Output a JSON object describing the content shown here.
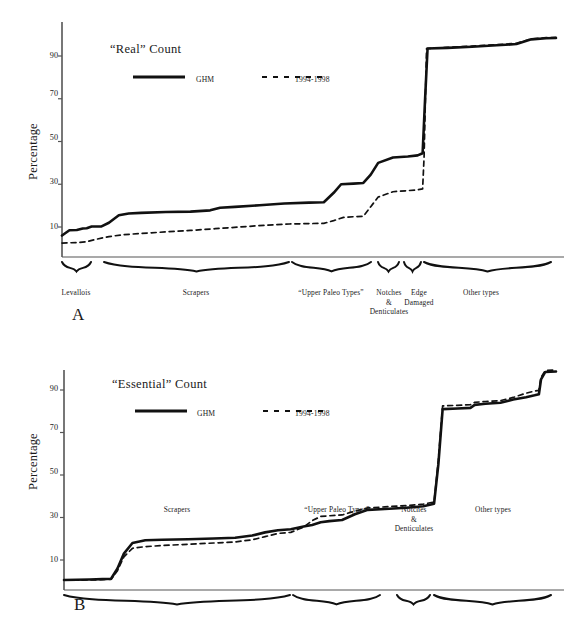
{
  "figure": {
    "background": "#ffffff",
    "line_color": "#111111",
    "axis_color": "#555555"
  },
  "panels": [
    {
      "letter": "A",
      "legend_title": "“Real” Count",
      "legend": [
        {
          "style": "solid",
          "label": "GHM"
        },
        {
          "style": "dashed",
          "label": "1994-1998"
        }
      ],
      "ylabel": "Percentage",
      "yticks": [
        10,
        30,
        50,
        70,
        90
      ],
      "groups": [
        {
          "label": "Levallois",
          "x0": 62,
          "x1": 91
        },
        {
          "label": "Scrapers",
          "x0": 104,
          "x1": 289
        },
        {
          "label": "“Upper Paleo Types”",
          "x0": 292,
          "x1": 371
        },
        {
          "label": "Notches\n&\nDenticulates",
          "x0": 378,
          "x1": 399
        },
        {
          "label": "Edge\nDamaged",
          "x0": 404,
          "x1": 421
        },
        {
          "label": "Other types",
          "x0": 424,
          "x1": 551
        }
      ]
    },
    {
      "letter": "B",
      "legend_title": "“Essential” Count",
      "legend": [
        {
          "style": "solid",
          "label": "GHM"
        },
        {
          "style": "dashed",
          "label": "1994-1998"
        }
      ],
      "ylabel": "Percentage",
      "yticks": [
        10,
        30,
        50,
        70,
        90
      ],
      "groups": [
        {
          "label": "Scrapers",
          "x0": 64,
          "x1": 290
        },
        {
          "label": "“Upper Paleo Types”",
          "x0": 293,
          "x1": 380
        },
        {
          "label": "Notches\n&\nDenticulates",
          "x0": 397,
          "x1": 430
        },
        {
          "label": "Other types",
          "x0": 434,
          "x1": 551
        }
      ]
    }
  ],
  "chart_data": [
    {
      "type": "line",
      "title": "“Real” Count",
      "panel": "A",
      "xlabel": "",
      "ylabel": "Percentage",
      "ylim": [
        0,
        102
      ],
      "yticks": [
        10,
        30,
        50,
        70,
        90
      ],
      "grid": false,
      "legend_position": "top-left",
      "note": "Cumulative percentage curves across ordered artifact type groups; x is an ordinal tool-type index, not numerically labeled.",
      "categories": [
        "Levallois",
        "Scrapers",
        "“Upper Paleo Types”",
        "Notches & Denticulates",
        "Edge Damaged",
        "Other types"
      ],
      "series": [
        {
          "name": "GHM",
          "style": "solid",
          "points": [
            [
              0.0,
              6.0
            ],
            [
              1.5,
              8.5
            ],
            [
              3.0,
              8.6
            ],
            [
              4.2,
              9.3
            ],
            [
              5.0,
              9.4
            ],
            [
              6.0,
              10.2
            ],
            [
              8.0,
              10.3
            ],
            [
              9.5,
              12.0
            ],
            [
              11.5,
              15.5
            ],
            [
              13.5,
              16.3
            ],
            [
              16.0,
              16.6
            ],
            [
              21.0,
              17.0
            ],
            [
              26.0,
              17.2
            ],
            [
              30.0,
              17.8
            ],
            [
              32.0,
              19.0
            ],
            [
              35.0,
              19.4
            ],
            [
              40.0,
              20.2
            ],
            [
              45.0,
              21.0
            ],
            [
              50.0,
              21.4
            ],
            [
              53.0,
              21.6
            ],
            [
              55.0,
              26.0
            ],
            [
              56.5,
              30.0
            ],
            [
              59.0,
              30.3
            ],
            [
              61.0,
              30.6
            ],
            [
              62.5,
              34.5
            ],
            [
              64.0,
              40.0
            ],
            [
              67.0,
              42.5
            ],
            [
              70.0,
              43.0
            ],
            [
              72.0,
              43.5
            ],
            [
              73.0,
              44.5
            ],
            [
              73.5,
              70.0
            ],
            [
              74.0,
              93.5
            ],
            [
              78.0,
              93.8
            ],
            [
              83.0,
              94.3
            ],
            [
              88.0,
              95.0
            ],
            [
              92.0,
              95.6
            ],
            [
              95.0,
              97.8
            ],
            [
              98.0,
              98.3
            ],
            [
              100.0,
              98.4
            ]
          ]
        },
        {
          "name": "1994-1998",
          "style": "dashed",
          "points": [
            [
              0.0,
              2.5
            ],
            [
              3.0,
              2.7
            ],
            [
              5.0,
              3.1
            ],
            [
              7.0,
              4.3
            ],
            [
              9.5,
              5.5
            ],
            [
              12.0,
              6.3
            ],
            [
              16.0,
              7.0
            ],
            [
              21.0,
              7.7
            ],
            [
              26.0,
              8.4
            ],
            [
              31.0,
              9.2
            ],
            [
              36.0,
              10.0
            ],
            [
              41.0,
              10.8
            ],
            [
              46.0,
              11.4
            ],
            [
              50.0,
              11.6
            ],
            [
              53.0,
              11.7
            ],
            [
              55.0,
              13.0
            ],
            [
              57.0,
              14.5
            ],
            [
              59.0,
              14.8
            ],
            [
              61.0,
              15.0
            ],
            [
              62.5,
              19.5
            ],
            [
              64.0,
              24.0
            ],
            [
              67.0,
              26.5
            ],
            [
              70.0,
              27.0
            ],
            [
              72.0,
              27.4
            ],
            [
              73.0,
              27.8
            ],
            [
              73.3,
              43.0
            ],
            [
              73.8,
              93.5
            ],
            [
              78.0,
              94.0
            ],
            [
              83.0,
              94.6
            ],
            [
              88.0,
              95.3
            ],
            [
              92.0,
              95.9
            ],
            [
              95.0,
              98.0
            ],
            [
              98.0,
              98.6
            ],
            [
              100.0,
              98.7
            ]
          ]
        }
      ]
    },
    {
      "type": "line",
      "title": "“Essential” Count",
      "panel": "B",
      "xlabel": "",
      "ylabel": "Percentage",
      "ylim": [
        0,
        102
      ],
      "yticks": [
        10,
        30,
        50,
        70,
        90
      ],
      "grid": false,
      "legend_position": "top-left",
      "note": "Cumulative percentage curves across ordered artifact type groups; x is an ordinal tool-type index, not numerically labeled.",
      "categories": [
        "Scrapers",
        "“Upper Paleo Types”",
        "Notches & Denticulates",
        "Other types"
      ],
      "series": [
        {
          "name": "GHM",
          "style": "solid",
          "points": [
            [
              0.0,
              0.6
            ],
            [
              3.0,
              0.7
            ],
            [
              6.0,
              0.8
            ],
            [
              9.0,
              1.0
            ],
            [
              11.0,
              1.2
            ],
            [
              12.5,
              6.0
            ],
            [
              14.0,
              13.0
            ],
            [
              16.0,
              18.0
            ],
            [
              19.0,
              19.3
            ],
            [
              23.0,
              19.5
            ],
            [
              29.0,
              19.8
            ],
            [
              35.0,
              20.1
            ],
            [
              40.0,
              20.5
            ],
            [
              44.0,
              21.5
            ],
            [
              47.0,
              23.0
            ],
            [
              50.0,
              24.0
            ],
            [
              53.0,
              24.5
            ],
            [
              56.0,
              25.8
            ],
            [
              58.0,
              26.5
            ],
            [
              60.0,
              27.8
            ],
            [
              62.0,
              28.3
            ],
            [
              65.0,
              28.8
            ],
            [
              68.0,
              31.5
            ],
            [
              71.0,
              33.6
            ],
            [
              75.0,
              34.0
            ],
            [
              80.0,
              34.6
            ],
            [
              84.0,
              35.3
            ],
            [
              86.5,
              36.5
            ],
            [
              87.5,
              55.0
            ],
            [
              88.5,
              81.0
            ],
            [
              92.0,
              81.3
            ],
            [
              95.0,
              81.6
            ],
            [
              96.0,
              83.0
            ],
            [
              98.5,
              83.5
            ],
            [
              102.0,
              84.0
            ],
            [
              105.0,
              85.5
            ],
            [
              108.0,
              86.6
            ],
            [
              110.0,
              87.5
            ],
            [
              111.0,
              88.0
            ],
            [
              111.5,
              95.0
            ],
            [
              112.5,
              98.5
            ],
            [
              115.0,
              98.7
            ]
          ]
        },
        {
          "name": "1994-1998",
          "style": "dashed",
          "points": [
            [
              0.0,
              0.5
            ],
            [
              6.0,
              0.6
            ],
            [
              11.0,
              0.9
            ],
            [
              12.5,
              5.0
            ],
            [
              14.0,
              11.5
            ],
            [
              16.0,
              15.5
            ],
            [
              19.0,
              16.3
            ],
            [
              23.0,
              16.8
            ],
            [
              29.0,
              17.4
            ],
            [
              35.0,
              18.0
            ],
            [
              40.0,
              18.5
            ],
            [
              44.0,
              19.5
            ],
            [
              47.0,
              21.0
            ],
            [
              50.0,
              22.5
            ],
            [
              53.0,
              23.0
            ],
            [
              56.0,
              25.5
            ],
            [
              58.0,
              28.5
            ],
            [
              60.0,
              30.5
            ],
            [
              62.0,
              30.8
            ],
            [
              65.0,
              31.2
            ],
            [
              68.0,
              33.0
            ],
            [
              71.0,
              34.5
            ],
            [
              75.0,
              35.0
            ],
            [
              80.0,
              35.6
            ],
            [
              84.0,
              36.3
            ],
            [
              86.5,
              37.3
            ],
            [
              87.5,
              57.0
            ],
            [
              88.5,
              82.5
            ],
            [
              92.0,
              82.8
            ],
            [
              95.0,
              83.1
            ],
            [
              96.0,
              84.2
            ],
            [
              98.5,
              84.6
            ],
            [
              102.0,
              85.0
            ],
            [
              105.0,
              86.5
            ],
            [
              108.0,
              88.5
            ],
            [
              110.0,
              89.5
            ],
            [
              111.0,
              89.8
            ],
            [
              111.5,
              96.0
            ],
            [
              112.5,
              99.2
            ],
            [
              115.0,
              99.4
            ]
          ]
        }
      ]
    }
  ]
}
